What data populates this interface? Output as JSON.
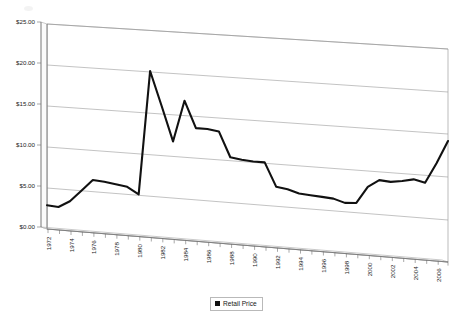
{
  "chart_data": {
    "type": "line",
    "title": "",
    "subtitle": "",
    "xlabel": "",
    "ylabel": "",
    "grid": true,
    "legend_position": "bottom-center",
    "ylim": [
      0,
      25
    ],
    "ytick_values": [
      0,
      5,
      10,
      15,
      20,
      25
    ],
    "ytick_labels": [
      "$0.00",
      "$5.00",
      "$10.00",
      "$15.00",
      "$20.00",
      "$25.00"
    ],
    "xtick_labels": [
      "1972",
      "1974",
      "1976",
      "1978",
      "1980",
      "1982",
      "1984",
      "1986",
      "1988",
      "1990",
      "1992",
      "1994",
      "1996",
      "1998",
      "2000",
      "2002",
      "2004",
      "2006"
    ],
    "x": [
      1972,
      1973,
      1974,
      1975,
      1976,
      1977,
      1978,
      1979,
      1980,
      1981,
      1982,
      1983,
      1984,
      1985,
      1986,
      1987,
      1988,
      1989,
      1990,
      1991,
      1992,
      1993,
      1994,
      1995,
      1996,
      1997,
      1998,
      1999,
      2000,
      2001,
      2002,
      2003,
      2004,
      2005,
      2006,
      2007
    ],
    "series": [
      {
        "name": "Retail Price",
        "color": "#111111",
        "values": [
          2.9,
          2.8,
          3.6,
          5.0,
          6.4,
          6.3,
          6.1,
          5.9,
          5.1,
          20.1,
          16.0,
          11.8,
          16.8,
          13.6,
          13.6,
          13.4,
          10.4,
          10.2,
          10.1,
          10.1,
          7.3,
          7.1,
          6.7,
          6.6,
          6.5,
          6.4,
          6.0,
          6.1,
          8.1,
          9.0,
          8.9,
          9.1,
          9.4,
          9.1,
          11.5,
          14.2
        ]
      }
    ],
    "legend": [
      {
        "label": "Retail Price",
        "marker": "square",
        "color": "#111111"
      }
    ]
  },
  "legend": {
    "entry_label": "Retail Price"
  },
  "axes": {
    "y_title": "",
    "x_title": ""
  }
}
